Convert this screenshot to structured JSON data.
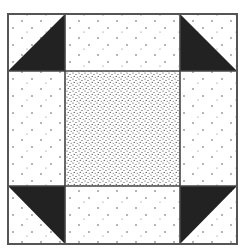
{
  "diagram": {
    "type": "quilt-block",
    "pattern": "shoo-fly",
    "colors": {
      "background": "#ffffff",
      "border": "#555555",
      "triangle": "#222222",
      "dots": "#555555",
      "stipple": "#333333"
    },
    "grid": {
      "x": [
        8,
        65,
        180,
        237
      ],
      "y": [
        14,
        71,
        186,
        244
      ]
    },
    "corners": [
      {
        "position": "top-left",
        "triangle": "lower-right"
      },
      {
        "position": "top-right",
        "triangle": "lower-left"
      },
      {
        "position": "bottom-left",
        "triangle": "upper-right"
      },
      {
        "position": "bottom-right",
        "triangle": "upper-left"
      }
    ],
    "center": {
      "fill": "dense-stipple"
    },
    "edges": {
      "fill": "sparse-dots"
    }
  }
}
